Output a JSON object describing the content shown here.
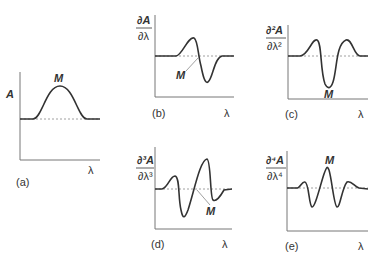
{
  "figure": {
    "panels": [
      {
        "id": "a",
        "label": "(a)",
        "ylabel_num": "A",
        "ylabel_den": "",
        "xlabel": "λ",
        "marker": "M",
        "description": "zero-order absorption band (Gaussian peak)"
      },
      {
        "id": "b",
        "label": "(b)",
        "ylabel_num": "∂A",
        "ylabel_den": "∂λ",
        "xlabel": "λ",
        "marker": "M",
        "description": "first derivative: maximum then minimum, zero crossing at M"
      },
      {
        "id": "c",
        "label": "(c)",
        "ylabel_num": "∂²A",
        "ylabel_den": "∂λ²",
        "xlabel": "λ",
        "marker": "M",
        "description": "second derivative: two satellite maxima, central minimum at M"
      },
      {
        "id": "d",
        "label": "(d)",
        "ylabel_num": "∂³A",
        "ylabel_den": "∂λ³",
        "xlabel": "λ",
        "marker": "M",
        "description": "third derivative: zero crossing at M"
      },
      {
        "id": "e",
        "label": "(e)",
        "ylabel_num": "∂⁴A",
        "ylabel_den": "∂λ⁴",
        "xlabel": "λ",
        "marker": "M",
        "description": "fourth derivative: central maximum at M"
      }
    ]
  }
}
